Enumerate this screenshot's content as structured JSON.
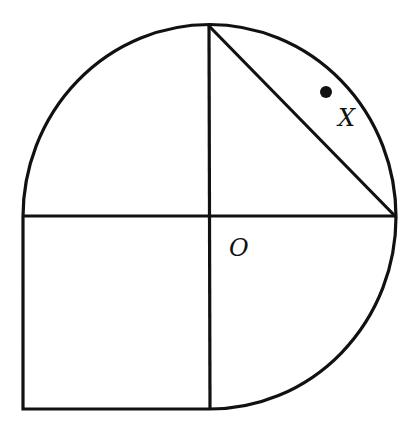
{
  "diagram": {
    "center": {
      "label": "O",
      "x": 209,
      "y": 216
    },
    "radius": 187,
    "labels": {
      "center": "O",
      "point": "X"
    },
    "point_x_marker": {
      "x": 326,
      "y": 91
    },
    "colors": {
      "stroke": "#111111",
      "background": "#ffffff"
    }
  }
}
